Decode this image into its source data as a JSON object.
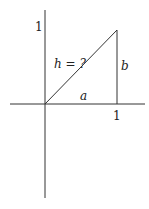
{
  "diagram": {
    "labels": {
      "y_tick": "1",
      "x_tick": "1",
      "hypotenuse": "h = ?",
      "horizontal_leg": "a",
      "vertical_leg": "b"
    },
    "colors": {
      "line": "#333333",
      "background": "#ffffff"
    }
  }
}
